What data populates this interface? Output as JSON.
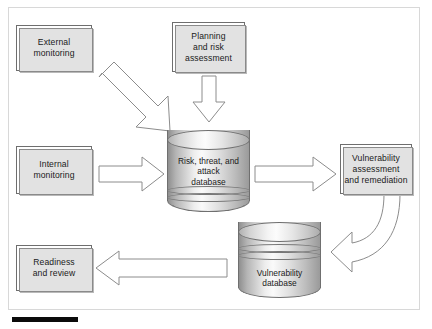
{
  "diagram": {
    "nodes": [
      {
        "id": "external-monitoring",
        "label": "External\nmonitoring",
        "line1": "External",
        "line2": "monitoring",
        "type": "process-box"
      },
      {
        "id": "planning-risk-assessment",
        "label": "Planning and risk assessment",
        "line1": "Planning",
        "line2": "and risk",
        "line3": "assessment",
        "type": "process-box"
      },
      {
        "id": "internal-monitoring",
        "label": "Internal monitoring",
        "line1": "Internal",
        "line2": "monitoring",
        "type": "process-box"
      },
      {
        "id": "risk-threat-attack-database",
        "label": "Risk, threat, and attack database",
        "line1": "Risk, threat, and",
        "line2": "attack",
        "line3": "database",
        "type": "cylinder-database"
      },
      {
        "id": "vulnerability-assessment-remediation",
        "label": "Vulnerability assessment and remediation",
        "line1": "Vulnerability",
        "line2": "assessment",
        "line3": "and remediation",
        "type": "process-box"
      },
      {
        "id": "vulnerability-database",
        "label": "Vulnerability database",
        "line1": "Vulnerability",
        "line2": "database",
        "type": "cylinder-database"
      },
      {
        "id": "readiness-review",
        "label": "Readiness and review",
        "line1": "Readiness",
        "line2": "and review",
        "type": "process-box"
      }
    ],
    "edges": [
      {
        "id": "external-to-database",
        "from": "external-monitoring",
        "to": "risk-threat-attack-database",
        "style": "block-arrow-diagonal",
        "direction": "down-right"
      },
      {
        "id": "planning-to-database",
        "from": "planning-risk-assessment",
        "to": "risk-threat-attack-database",
        "style": "block-arrow",
        "direction": "down"
      },
      {
        "id": "internal-to-database",
        "from": "internal-monitoring",
        "to": "risk-threat-attack-database",
        "style": "block-arrow",
        "direction": "right"
      },
      {
        "id": "database-to-assessment",
        "from": "risk-threat-attack-database",
        "to": "vulnerability-assessment-remediation",
        "style": "block-arrow",
        "direction": "right"
      },
      {
        "id": "assessment-to-vulndb",
        "from": "vulnerability-assessment-remediation",
        "to": "vulnerability-database",
        "style": "block-arrow-curved",
        "direction": "down-left"
      },
      {
        "id": "vulndb-to-readiness",
        "from": "vulnerability-database",
        "to": "readiness-review",
        "style": "block-arrow",
        "direction": "left"
      }
    ],
    "colors": {
      "frame_border": "#d8d8d8",
      "box_border": "#6e6e6e",
      "box_fill": "#ffffff",
      "box_shadow": "#b9b9b9",
      "arrow_stroke": "#8c8c8c",
      "arrow_fill": "#ffffff",
      "cylinder_light": "#fafafa",
      "cylinder_dark": "#8f8f8f",
      "text": "#1a1a1a",
      "rule": "#0b0b0b"
    }
  }
}
